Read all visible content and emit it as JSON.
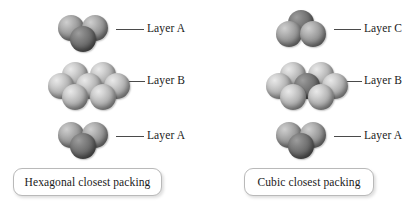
{
  "figure": {
    "background_color": "#ffffff",
    "sphere_colors": {
      "light": "#b0b0b0",
      "mid": "#949494",
      "dark": "#6c6c6c"
    },
    "leader_line_color": "#4a4a4a",
    "caption_border_color": "#b9b9b9"
  },
  "panels": [
    {
      "id": "hexagonal",
      "caption": "Hexagonal closest packing",
      "layers": [
        {
          "id": "hcp-top",
          "label": "Layer A",
          "sphere_count": 3,
          "shading": [
            "mid",
            "mid",
            "dark"
          ]
        },
        {
          "id": "hcp-middle",
          "label": "Layer B",
          "sphere_count": 7,
          "shading": [
            "light",
            "light",
            "light",
            "light",
            "light",
            "light",
            "light"
          ]
        },
        {
          "id": "hcp-bottom",
          "label": "Layer A",
          "sphere_count": 3,
          "shading": [
            "mid",
            "mid",
            "dark"
          ]
        }
      ]
    },
    {
      "id": "cubic",
      "caption": "Cubic closest packing",
      "layers": [
        {
          "id": "ccp-top",
          "label": "Layer C",
          "sphere_count": 3,
          "shading": [
            "dark",
            "mid",
            "mid"
          ]
        },
        {
          "id": "ccp-middle",
          "label": "Layer B",
          "sphere_count": 7,
          "shading": [
            "light",
            "light",
            "light",
            "light",
            "light",
            "light",
            "dark"
          ]
        },
        {
          "id": "ccp-bottom",
          "label": "Layer A",
          "sphere_count": 3,
          "shading": [
            "mid",
            "mid",
            "dark"
          ]
        }
      ]
    }
  ]
}
